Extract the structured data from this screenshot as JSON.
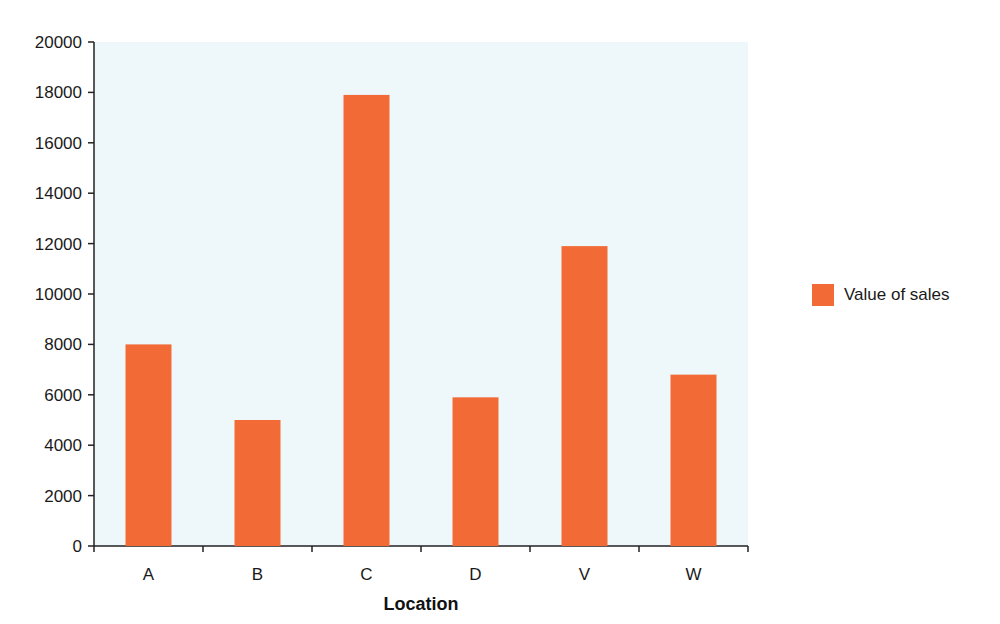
{
  "chart_data": {
    "type": "bar",
    "title": "",
    "xlabel": "Location",
    "ylabel": "",
    "categories": [
      "A",
      "B",
      "C",
      "D",
      "V",
      "W"
    ],
    "series": [
      {
        "name": "Value of sales",
        "values": [
          8000,
          5000,
          17900,
          5900,
          11900,
          6800
        ],
        "color": "#f26a35"
      }
    ],
    "ylim": [
      0,
      20000
    ],
    "yticks": [
      0,
      2000,
      4000,
      6000,
      8000,
      10000,
      12000,
      14000,
      16000,
      18000,
      20000
    ],
    "grid": false,
    "legend_position": "right",
    "plot_background": "#eef8fb"
  },
  "legend": {
    "label": "Value of sales"
  }
}
